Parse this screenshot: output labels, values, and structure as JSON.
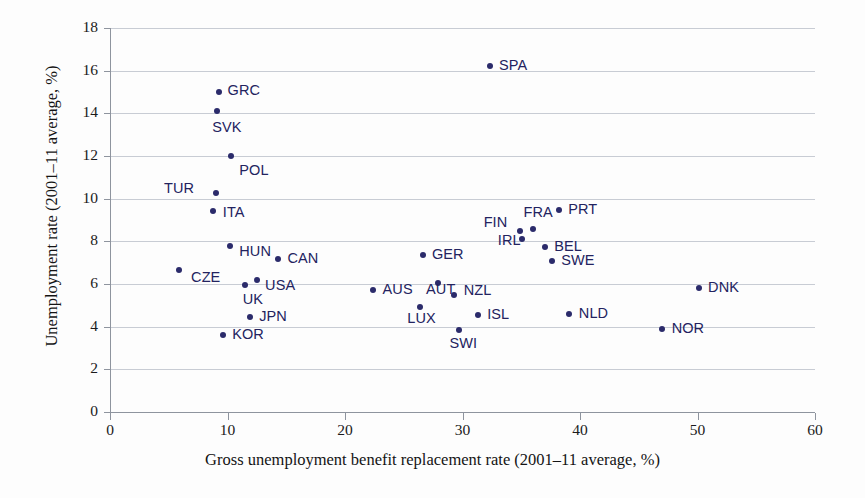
{
  "chart_data": {
    "type": "scatter",
    "title": "",
    "xlabel": "Gross unemployment benefit replacement rate (2001–11 average, %)",
    "ylabel": "Unemployment rate (2001–11 average, %)",
    "xlim": [
      0,
      60
    ],
    "ylim": [
      0,
      18
    ],
    "xticks": [
      0,
      10,
      20,
      30,
      40,
      50,
      60
    ],
    "yticks": [
      0,
      2,
      4,
      6,
      8,
      10,
      12,
      14,
      16,
      18
    ],
    "grid": "horizontal",
    "legend": "none",
    "marker_color": "#2b2b6b",
    "label_color": "#23235f",
    "points": [
      {
        "label": "GRC",
        "x": 9.3,
        "y": 15.0,
        "lx": 10,
        "ly": 15.05
      },
      {
        "label": "SVK",
        "x": 9.1,
        "y": 14.1,
        "lx": 8.7,
        "ly": 13.3
      },
      {
        "label": "POL",
        "x": 10.3,
        "y": 12.0,
        "lx": 11.0,
        "ly": 11.3
      },
      {
        "label": "TUR",
        "x": 9.0,
        "y": 10.25,
        "lx": 4.6,
        "ly": 10.45
      },
      {
        "label": "ITA",
        "x": 8.8,
        "y": 9.4,
        "lx": 9.6,
        "ly": 9.35
      },
      {
        "label": "HUN",
        "x": 10.2,
        "y": 7.8,
        "lx": 11.0,
        "ly": 7.5
      },
      {
        "label": "CZE",
        "x": 5.9,
        "y": 6.65,
        "lx": 6.9,
        "ly": 6.3
      },
      {
        "label": "CAN",
        "x": 14.3,
        "y": 7.15,
        "lx": 15.1,
        "ly": 7.15
      },
      {
        "label": "USA",
        "x": 12.5,
        "y": 6.2,
        "lx": 13.2,
        "ly": 5.9
      },
      {
        "label": "UK",
        "x": 11.5,
        "y": 5.95,
        "lx": 11.3,
        "ly": 5.25
      },
      {
        "label": "JPN",
        "x": 11.9,
        "y": 4.45,
        "lx": 12.7,
        "ly": 4.45
      },
      {
        "label": "KOR",
        "x": 9.6,
        "y": 3.6,
        "lx": 10.4,
        "ly": 3.6
      },
      {
        "label": "SPA",
        "x": 32.3,
        "y": 16.2,
        "lx": 33.1,
        "ly": 16.2
      },
      {
        "label": "PRT",
        "x": 38.2,
        "y": 9.45,
        "lx": 39.0,
        "ly": 9.45
      },
      {
        "label": "FRA",
        "x": 36.0,
        "y": 8.6,
        "lx": 35.2,
        "ly": 9.35
      },
      {
        "label": "FIN",
        "x": 34.9,
        "y": 8.5,
        "lx": 31.8,
        "ly": 8.85
      },
      {
        "label": "IRL",
        "x": 35.1,
        "y": 8.1,
        "lx": 33.0,
        "ly": 8.0
      },
      {
        "label": "BEL",
        "x": 37.0,
        "y": 7.75,
        "lx": 37.8,
        "ly": 7.75
      },
      {
        "label": "SWE",
        "x": 37.6,
        "y": 7.1,
        "lx": 38.4,
        "ly": 7.1
      },
      {
        "label": "GER",
        "x": 26.6,
        "y": 7.35,
        "lx": 27.4,
        "ly": 7.35
      },
      {
        "label": "AUS",
        "x": 22.4,
        "y": 5.7,
        "lx": 23.2,
        "ly": 5.7
      },
      {
        "label": "AUT",
        "x": 27.9,
        "y": 6.05,
        "lx": 26.9,
        "ly": 5.7
      },
      {
        "label": "NZL",
        "x": 29.3,
        "y": 5.5,
        "lx": 30.1,
        "ly": 5.65
      },
      {
        "label": "LUX",
        "x": 26.4,
        "y": 4.9,
        "lx": 25.3,
        "ly": 4.35
      },
      {
        "label": "SWI",
        "x": 29.7,
        "y": 3.85,
        "lx": 28.9,
        "ly": 3.2
      },
      {
        "label": "ISL",
        "x": 31.3,
        "y": 4.55,
        "lx": 32.1,
        "ly": 4.55
      },
      {
        "label": "NLD",
        "x": 39.1,
        "y": 4.6,
        "lx": 39.9,
        "ly": 4.6
      },
      {
        "label": "DNK",
        "x": 50.1,
        "y": 5.8,
        "lx": 50.9,
        "ly": 5.8
      },
      {
        "label": "NOR",
        "x": 47.0,
        "y": 3.9,
        "lx": 47.8,
        "ly": 3.9
      }
    ]
  }
}
